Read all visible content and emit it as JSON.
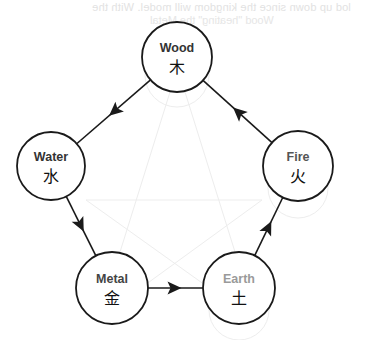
{
  "diagram": {
    "stroke_color": "#1a1a1a",
    "nodes": [
      {
        "id": "wood",
        "label": "Wood",
        "glyph": "木",
        "cx": 177,
        "cy": 57,
        "r": 35,
        "label_color": "#333333"
      },
      {
        "id": "water",
        "label": "Water",
        "glyph": "水",
        "cx": 51,
        "cy": 166,
        "r": 34,
        "label_color": "#333333"
      },
      {
        "id": "fire",
        "label": "Fire",
        "glyph": "火",
        "cx": 298,
        "cy": 166,
        "r": 35,
        "label_color": "#555555"
      },
      {
        "id": "metal",
        "label": "Metal",
        "glyph": "金",
        "cx": 112,
        "cy": 288,
        "r": 36,
        "label_color": "#444444"
      },
      {
        "id": "earth",
        "label": "Earth",
        "glyph": "土",
        "cx": 239,
        "cy": 288,
        "r": 36,
        "label_color": "#9a9a9a"
      }
    ],
    "edges": [
      {
        "from": "wood",
        "to": "water"
      },
      {
        "from": "water",
        "to": "metal"
      },
      {
        "from": "metal",
        "to": "earth"
      },
      {
        "from": "earth",
        "to": "fire"
      },
      {
        "from": "fire",
        "to": "wood"
      }
    ]
  },
  "bleed_through": {
    "line1": "lod up down since the kingdom will model. With the",
    "line2": "Wood \"heating\" the Metal"
  }
}
